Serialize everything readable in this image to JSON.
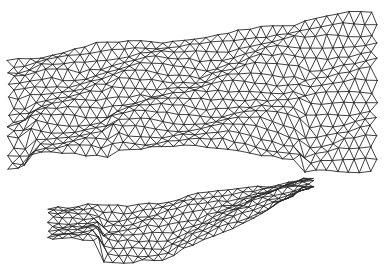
{
  "figure": {
    "title": "",
    "kind": "triangulated wireframe terrain surface",
    "line_color": "#2a2a2a",
    "background_color": "#ffffff",
    "components": [
      {
        "name": "upper-surface",
        "description": "large wavy terrain band spanning full width"
      },
      {
        "name": "lower-surface",
        "description": "smaller elongated terrain strip in lower half"
      }
    ]
  }
}
